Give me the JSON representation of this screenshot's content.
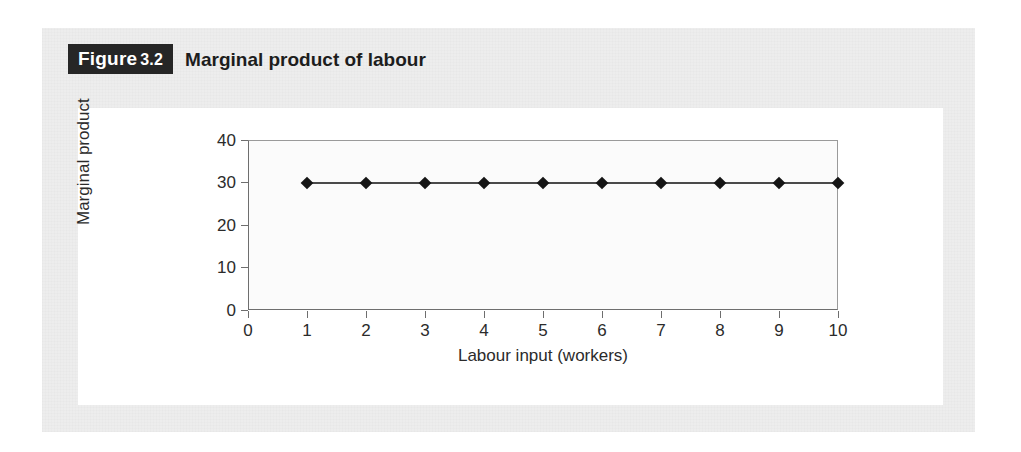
{
  "figure": {
    "badge_prefix": "Figure",
    "badge_number": "3.2",
    "caption": "Marginal product of labour"
  },
  "chart_data": {
    "type": "line",
    "title": "Marginal product of labour",
    "xlabel": "Labour input (workers)",
    "ylabel": "Marginal product",
    "x": [
      1,
      2,
      3,
      4,
      5,
      6,
      7,
      8,
      9,
      10
    ],
    "values": [
      30,
      30,
      30,
      30,
      30,
      30,
      30,
      30,
      30,
      30
    ],
    "series": [
      {
        "name": "Marginal product of labour",
        "values": [
          30,
          30,
          30,
          30,
          30,
          30,
          30,
          30,
          30,
          30
        ]
      }
    ],
    "xlim": [
      0,
      10
    ],
    "ylim": [
      0,
      40
    ],
    "x_ticks": [
      "0",
      "1",
      "2",
      "3",
      "4",
      "5",
      "6",
      "7",
      "8",
      "9",
      "10"
    ],
    "y_ticks": [
      "0",
      "10",
      "20",
      "30",
      "40"
    ],
    "grid": false,
    "legend": "none",
    "marker": "diamond",
    "marker_color": "#151515",
    "line_color": "#4a4a4a"
  }
}
